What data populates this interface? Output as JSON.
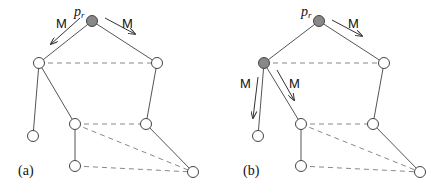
{
  "colors": {
    "filled_node": "#888888",
    "empty_node": "#ffffff",
    "edge": "#555555",
    "dashed_edge": "#888888"
  },
  "panels": [
    {
      "label": "(a)",
      "root_label": "p",
      "root_subscript": "r",
      "message_label": "M",
      "nodes": [
        {
          "id": "root",
          "x": 92,
          "y": 21,
          "filled": true
        },
        {
          "id": "L",
          "x": 39,
          "y": 63,
          "filled": false
        },
        {
          "id": "R",
          "x": 157,
          "y": 63,
          "filled": false
        },
        {
          "id": "LL",
          "x": 33,
          "y": 136,
          "filled": false
        },
        {
          "id": "LM",
          "x": 75,
          "y": 124,
          "filled": false
        },
        {
          "id": "RM",
          "x": 146,
          "y": 124,
          "filled": false
        },
        {
          "id": "LB",
          "x": 75,
          "y": 166,
          "filled": false
        },
        {
          "id": "RB",
          "x": 193,
          "y": 172,
          "filled": false
        }
      ]
    },
    {
      "label": "(b)",
      "root_label": "p",
      "root_subscript": "r",
      "message_label": "M",
      "nodes": [
        {
          "id": "root",
          "x": 319,
          "y": 21,
          "filled": true
        },
        {
          "id": "L",
          "x": 264,
          "y": 63,
          "filled": true
        },
        {
          "id": "R",
          "x": 384,
          "y": 63,
          "filled": false
        },
        {
          "id": "LL",
          "x": 258,
          "y": 136,
          "filled": false
        },
        {
          "id": "LM",
          "x": 301,
          "y": 124,
          "filled": false
        },
        {
          "id": "RM",
          "x": 373,
          "y": 124,
          "filled": false
        },
        {
          "id": "LB",
          "x": 301,
          "y": 166,
          "filled": false
        },
        {
          "id": "RB",
          "x": 420,
          "y": 172,
          "filled": false
        }
      ]
    }
  ]
}
